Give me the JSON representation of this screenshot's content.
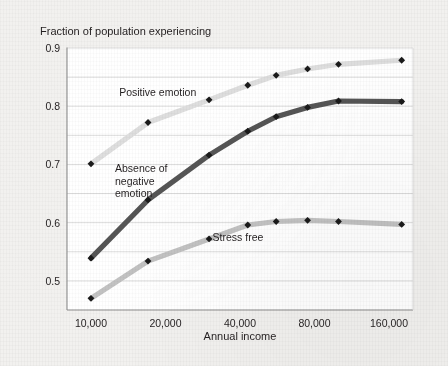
{
  "chart_data": {
    "type": "line",
    "title": "Fraction of population experiencing",
    "xlabel": "Annual income",
    "ylabel": "",
    "xscale": "log2",
    "xlim": [
      8000,
      200000
    ],
    "ylim": [
      0.45,
      0.9
    ],
    "grid": true,
    "legend_position": "inline-annotations",
    "xticks": [
      10000,
      20000,
      40000,
      80000,
      160000
    ],
    "xtick_labels": [
      "10,000",
      "20,000",
      "40,000",
      "80,000",
      "160,000"
    ],
    "yticks": [
      0.5,
      0.6,
      0.7,
      0.8,
      0.9
    ],
    "ytick_labels": [
      "0.5",
      "0.6",
      "0.7",
      "0.8",
      "0.9"
    ],
    "y_minor_ticks": [
      0.45,
      0.55,
      0.65,
      0.75,
      0.85
    ],
    "marker": "diamond",
    "marker_color": "#1a1a1a",
    "series": [
      {
        "name": "Positive emotion",
        "color": "#dedede",
        "label_x": 13000,
        "label_y": 0.818,
        "x": [
          10000,
          17000,
          30000,
          43000,
          56000,
          75000,
          100000,
          180000
        ],
        "values": [
          0.701,
          0.772,
          0.811,
          0.836,
          0.853,
          0.864,
          0.872,
          0.879
        ]
      },
      {
        "name": "Absence of negative emotion",
        "color": "#555555",
        "label_lines": [
          "Absence of",
          "negative",
          "emotion"
        ],
        "label_x": 12500,
        "label_y": 0.687,
        "x": [
          10000,
          17000,
          30000,
          43000,
          56000,
          75000,
          100000,
          180000
        ],
        "values": [
          0.539,
          0.639,
          0.716,
          0.757,
          0.782,
          0.798,
          0.809,
          0.808
        ]
      },
      {
        "name": "Stress free",
        "color": "#c2c2c2",
        "label_x": 31000,
        "label_y": 0.568,
        "x": [
          10000,
          17000,
          30000,
          43000,
          56000,
          75000,
          100000,
          180000
        ],
        "values": [
          0.47,
          0.534,
          0.572,
          0.596,
          0.602,
          0.604,
          0.602,
          0.597
        ]
      }
    ]
  },
  "figure": {
    "background_color": "#f2f1ef",
    "plot_background_color": "#ffffff",
    "axis_color": "#8c8c8c",
    "gridline_color": "#d8d8d8"
  }
}
